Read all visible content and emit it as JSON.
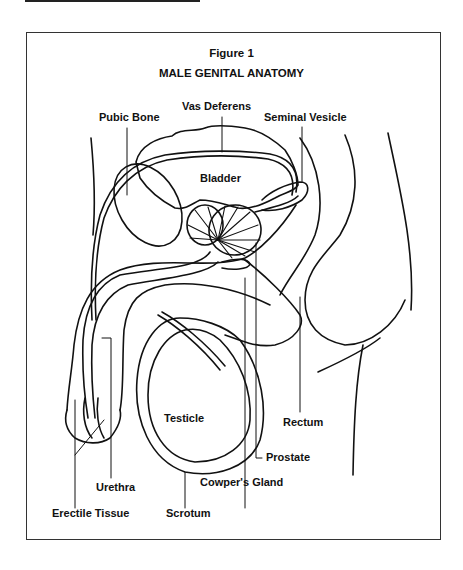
{
  "figure": {
    "number": "Figure 1",
    "title": "MALE GENITAL ANATOMY"
  },
  "labels": {
    "pubic_bone": "Pubic Bone",
    "vas_deferens": "Vas Deferens",
    "seminal_vesicle": "Seminal Vesicle",
    "bladder": "Bladder",
    "testicle": "Testicle",
    "rectum": "Rectum",
    "prostate": "Prostate",
    "cowpers_gland": "Cowper's Gland",
    "urethra": "Urethra",
    "erectile_tissue": "Erectile Tissue",
    "scrotum": "Scrotum"
  },
  "colors": {
    "line": "#111111",
    "background": "#ffffff"
  }
}
